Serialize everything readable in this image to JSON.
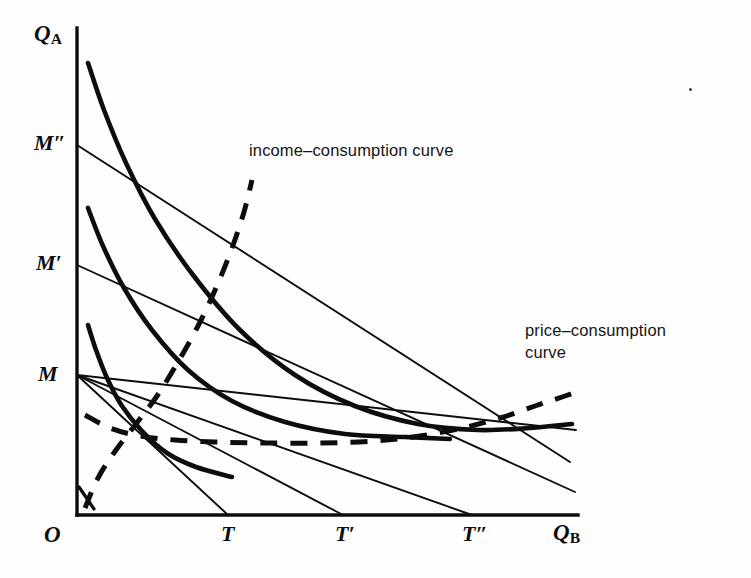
{
  "figure": {
    "background_color": "#fefefe",
    "ink_color": "#0d0d0d"
  },
  "axes": {
    "y_label": "Q",
    "y_label_sub": "A",
    "x_label": "Q",
    "x_label_sub": "B",
    "origin_label": "O",
    "y_ticks": [
      {
        "label": "M",
        "prime": ""
      },
      {
        "label": "M",
        "prime": "′"
      },
      {
        "label": "M",
        "prime": "″"
      }
    ],
    "x_ticks": [
      {
        "label": "T",
        "prime": ""
      },
      {
        "label": "T",
        "prime": "′"
      },
      {
        "label": "T",
        "prime": "″"
      }
    ]
  },
  "labels": {
    "income_consumption": "income–consumption curve",
    "price_consumption": "price–consumption\ncurve"
  },
  "chart_data": {
    "type": "line",
    "xlabel": "Q_B",
    "ylabel": "Q_A",
    "grid": false,
    "legend_position": "inline-annotations",
    "axis_ranges": {
      "x": [
        0,
        1
      ],
      "y": [
        0,
        1
      ]
    },
    "annotations": [
      {
        "text": "income–consumption curve",
        "x": 0.32,
        "y": 0.76
      },
      {
        "text": "price–consumption curve",
        "x": 0.86,
        "y": 0.4
      }
    ],
    "series": [
      {
        "name": "indifference-curve-1",
        "kind": "indifference",
        "style": "solid-thick",
        "note": "lowest indifference curve, tangent to budget line M-T",
        "points": [
          [
            88,
            325
          ],
          [
            96,
            350
          ],
          [
            107,
            378
          ],
          [
            122,
            406
          ],
          [
            142,
            431
          ],
          [
            167,
            453
          ],
          [
            196,
            467
          ],
          [
            232,
            477
          ]
        ]
      },
      {
        "name": "indifference-curve-2",
        "kind": "indifference",
        "style": "solid-thick",
        "note": "middle indifference curve, tangent to budget line M'-T'",
        "points": [
          [
            88,
            208
          ],
          [
            103,
            246
          ],
          [
            124,
            288
          ],
          [
            152,
            330
          ],
          [
            188,
            370
          ],
          [
            232,
            401
          ],
          [
            285,
            422
          ],
          [
            345,
            434
          ],
          [
            405,
            437
          ],
          [
            450,
            439
          ]
        ]
      },
      {
        "name": "indifference-curve-3",
        "kind": "indifference",
        "style": "solid-thick",
        "note": "highest indifference curve, tangent to budget line M''-T''",
        "points": [
          [
            88,
            63
          ],
          [
            104,
            110
          ],
          [
            126,
            163
          ],
          [
            155,
            219
          ],
          [
            193,
            275
          ],
          [
            240,
            330
          ],
          [
            295,
            375
          ],
          [
            355,
            406
          ],
          [
            418,
            424
          ],
          [
            478,
            430
          ],
          [
            530,
            428
          ],
          [
            572,
            424
          ]
        ]
      },
      {
        "name": "budget-line-M-T",
        "kind": "budget",
        "style": "solid-thin",
        "endpoints": [
          [
            77,
            375
          ],
          [
            228,
            515
          ]
        ]
      },
      {
        "name": "budget-line-M-T-prime",
        "kind": "budget",
        "style": "solid-thin",
        "endpoints": [
          [
            77,
            375
          ],
          [
            343,
            515
          ]
        ]
      },
      {
        "name": "budget-line-M-T-doubleprime",
        "kind": "budget",
        "style": "solid-thin",
        "endpoints": [
          [
            77,
            375
          ],
          [
            472,
            515
          ]
        ]
      },
      {
        "name": "budget-line-M-prime",
        "kind": "budget",
        "style": "solid-thin",
        "endpoints": [
          [
            77,
            265
          ],
          [
            575,
            492
          ]
        ]
      },
      {
        "name": "budget-line-M-doubleprime",
        "kind": "budget",
        "style": "solid-thin",
        "endpoints": [
          [
            77,
            145
          ],
          [
            570,
            462
          ]
        ]
      },
      {
        "name": "budget-line-M-flat",
        "kind": "budget",
        "style": "solid-thin",
        "endpoints": [
          [
            77,
            375
          ],
          [
            576,
            430
          ]
        ]
      },
      {
        "name": "income-consumption-curve",
        "kind": "locus",
        "style": "dashed-thick",
        "note": "dashed curve through tangency points, rising steeply to the right",
        "points": [
          [
            85,
            508
          ],
          [
            98,
            478
          ],
          [
            116,
            450
          ],
          [
            136,
            424
          ],
          [
            157,
            396
          ],
          [
            178,
            362
          ],
          [
            198,
            326
          ],
          [
            216,
            288
          ],
          [
            232,
            248
          ],
          [
            244,
            212
          ],
          [
            252,
            180
          ]
        ]
      },
      {
        "name": "price-consumption-curve",
        "kind": "locus",
        "style": "dashed-thick",
        "note": "dashed curve through tangency points, flat then rising to the right",
        "points": [
          [
            85,
            415
          ],
          [
            110,
            428
          ],
          [
            140,
            436
          ],
          [
            175,
            440
          ],
          [
            215,
            442
          ],
          [
            265,
            443
          ],
          [
            320,
            443
          ],
          [
            375,
            441
          ],
          [
            420,
            436
          ],
          [
            462,
            428
          ],
          [
            500,
            418
          ],
          [
            535,
            406
          ],
          [
            565,
            396
          ],
          [
            580,
            391
          ]
        ]
      }
    ]
  }
}
